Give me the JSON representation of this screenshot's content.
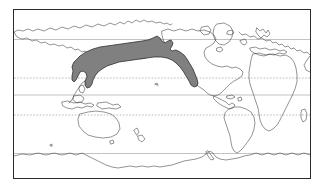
{
  "figure": {
    "kind": "distribution-range-map",
    "title": "",
    "caption": "",
    "projection": "equirectangular",
    "background_color": "#ffffff",
    "frame": {
      "visible": true,
      "color": "#2b2b2b",
      "line_width": 1,
      "x": 13,
      "y": 9,
      "width": 298,
      "height": 170
    }
  },
  "map": {
    "extent": {
      "lon_min": -180,
      "lon_max": 180,
      "lat_min": -90,
      "lat_max": 84
    },
    "ocean_color": "#ffffff",
    "land_fill": "#ffffff",
    "coastline_color": "#3a3a3a",
    "coastline_width": 0.55,
    "center_lon": 160
  },
  "graticule": {
    "visible": true,
    "lines": [
      {
        "name": "arctic-circle",
        "label": "Arctic Circle",
        "latitude": 66.5,
        "style": "solid",
        "color": "#9a9a9a",
        "y": 29.5
      },
      {
        "name": "tropic-of-cancer",
        "label": "Tropic of Cancer",
        "latitude": 23.5,
        "style": "dotted",
        "color": "#8d8d8d",
        "y": 68.0
      },
      {
        "name": "equator",
        "label": "Equator",
        "latitude": 0,
        "style": "solid",
        "color": "#9a9a9a",
        "y": 85.0
      },
      {
        "name": "tropic-of-capricorn",
        "label": "Tropic of Capricorn",
        "latitude": -23.5,
        "style": "dotted",
        "color": "#8d8d8d",
        "y": 105.0
      },
      {
        "name": "antarctic-circle",
        "label": "Antarctic Circle",
        "latitude": -66.5,
        "style": "solid",
        "color": "#9a9a9a",
        "y": 143.5
      }
    ]
  },
  "range": {
    "name": "north-pacific-distribution",
    "label": "Distribution range",
    "fill_color": "#808080",
    "outline_color": "#1e1e1e",
    "outline_width": 0.7,
    "ocean_basin": "North Pacific",
    "approx_lat_range": [
      30,
      62
    ],
    "approx_lon_range": [
      130,
      -120
    ],
    "regions_touched": [
      "Sea of Japan",
      "Sea of Okhotsk",
      "Kuril Islands",
      "Bering Sea",
      "Gulf of Alaska",
      "British Columbia coast",
      "California Current"
    ]
  },
  "legend": {
    "visible": false,
    "entries": []
  },
  "labels": {
    "visible": false,
    "items": []
  }
}
